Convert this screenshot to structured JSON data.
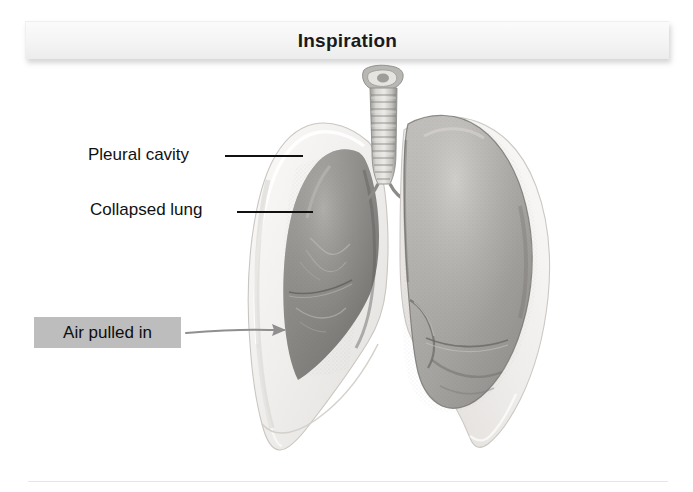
{
  "banner": {
    "title": "Inspiration"
  },
  "labels": {
    "pleural_cavity": "Pleural cavity",
    "collapsed_lung": "Collapsed lung",
    "air_pulled_in": "Air pulled in"
  },
  "figure": {
    "parts": [
      "larynx",
      "trachea",
      "pleural cavity",
      "collapsed lung",
      "inflated lung"
    ]
  },
  "colors": {
    "background": "#ffffff",
    "banner_fill": "#f4f4f4",
    "banner_text": "#1a1a1a",
    "label_text": "#111111",
    "leader_line": "#111111",
    "callout_highlight": "#bdbdbd",
    "arrow": "#9a9a9a",
    "pleural_membrane": "#f2f0ee",
    "collapsed_lung": "#8e8c8a",
    "inflated_lung": "#a9a7a5",
    "trachea": "#c8c6c4"
  }
}
